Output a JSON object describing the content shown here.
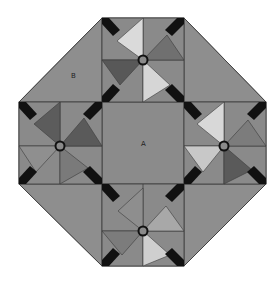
{
  "diagram": {
    "type": "quilt-block",
    "labels": {
      "center": "A",
      "corner": "B"
    },
    "colors": {
      "background": "#8c8c8c",
      "medium": "#8a8a8a",
      "dark_triangle": "#5a5a5a",
      "light_triangle": "#d8d8d8",
      "mid_triangle": "#a8a8a8",
      "sash": "#111111",
      "outline": "#3a3a3a",
      "page": "#ffffff"
    },
    "blocks": [
      {
        "name": "top-pinwheel",
        "position": "top"
      },
      {
        "name": "left-pinwheel",
        "position": "left"
      },
      {
        "name": "right-pinwheel",
        "position": "right"
      },
      {
        "name": "bottom-pinwheel",
        "position": "bottom"
      }
    ]
  }
}
